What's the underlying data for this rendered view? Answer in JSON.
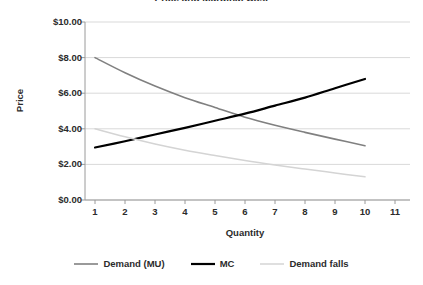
{
  "chart_data": {
    "type": "line",
    "title": "Price and Marginal Cost",
    "xlabel": "Quantity",
    "ylabel": "Price",
    "xlim": [
      0.5,
      11.5
    ],
    "ylim": [
      0,
      10
    ],
    "grid": true,
    "legend_position": "bottom",
    "x_tick_labels": [
      "1",
      "2",
      "3",
      "4",
      "5",
      "6",
      "7",
      "8",
      "9",
      "10",
      "11"
    ],
    "y_tick_labels": [
      "$0.00",
      "$2.00",
      "$4.00",
      "$6.00",
      "$8.00",
      "$10.00"
    ],
    "y_tick_values": [
      0,
      2,
      4,
      6,
      8,
      10
    ],
    "x": [
      1,
      2,
      3,
      4,
      5,
      6,
      7,
      8,
      9,
      10
    ],
    "series": [
      {
        "name": "Demand (MU)",
        "color": "#808080",
        "width": 1.6,
        "values": [
          8.0,
          7.15,
          6.4,
          5.75,
          5.2,
          4.65,
          4.2,
          3.8,
          3.42,
          3.05
        ]
      },
      {
        "name": "MC",
        "color": "#000000",
        "width": 2.2,
        "values": [
          2.95,
          3.3,
          3.68,
          4.05,
          4.45,
          4.85,
          5.3,
          5.75,
          6.28,
          6.8
        ]
      },
      {
        "name": "Demand falls",
        "color": "#d4d4d4",
        "width": 1.5,
        "values": [
          4.0,
          3.55,
          3.15,
          2.8,
          2.5,
          2.22,
          1.97,
          1.74,
          1.52,
          1.3
        ]
      }
    ]
  }
}
